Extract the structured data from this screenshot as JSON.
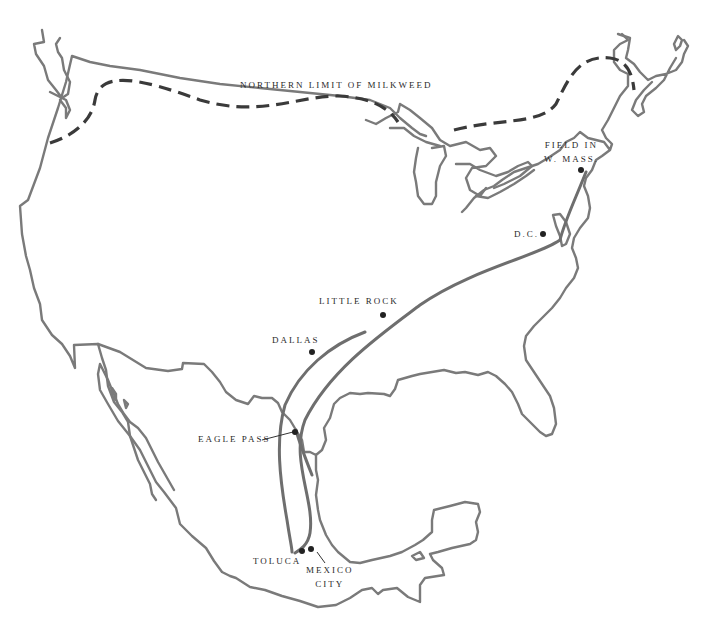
{
  "map": {
    "title": "Monarch migration route map",
    "colors": {
      "coastline": "#7a7a7a",
      "route": "#6e6e6e",
      "milkweed_limit": "#3a3a3a",
      "city_dot": "#222222",
      "label_text": "#2a2a2a",
      "background": "#ffffff"
    },
    "legend_line": {
      "label": "NORTHERN LIMIT OF MILKWEED",
      "style": "dashed"
    },
    "places": [
      {
        "id": "field-w-mass",
        "label_line1": "FIELD IN",
        "label_line2": "W. MASS."
      },
      {
        "id": "dc",
        "label": "D.C."
      },
      {
        "id": "little-rock",
        "label": "LITTLE ROCK"
      },
      {
        "id": "dallas",
        "label": "DALLAS"
      },
      {
        "id": "eagle-pass",
        "label": "EAGLE PASS"
      },
      {
        "id": "toluca",
        "label": "TOLUCA"
      },
      {
        "id": "mexico-city",
        "label_line1": "MEXICO",
        "label_line2": "CITY"
      }
    ]
  }
}
